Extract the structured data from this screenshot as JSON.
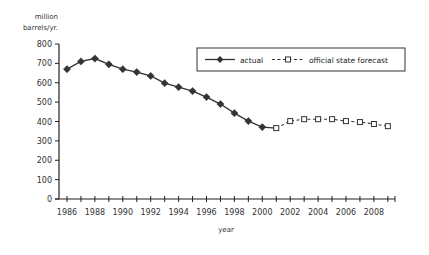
{
  "chart_data": {
    "type": "line",
    "title": "",
    "ylabel": "million barrels/yr.",
    "ylabel_lines": [
      "million",
      "barrels/yr."
    ],
    "xlabel": "year",
    "ylim": [
      0,
      800
    ],
    "yticks": [
      0,
      100,
      200,
      300,
      400,
      500,
      600,
      700,
      800
    ],
    "xlim": [
      1986,
      2009
    ],
    "xtick_labels": [
      "1986",
      "1988",
      "1990",
      "1992",
      "1994",
      "1996",
      "1998",
      "2000",
      "2002",
      "2004",
      "2006",
      "2008"
    ],
    "grid": false,
    "legend_position": "upper right",
    "series": [
      {
        "name": "actual",
        "style": "solid line, filled diamond markers",
        "color": "#333333",
        "x": [
          1986,
          1987,
          1988,
          1989,
          1990,
          1991,
          1992,
          1993,
          1994,
          1995,
          1996,
          1997,
          1998,
          1999,
          2000,
          2001
        ],
        "values": [
          670,
          710,
          725,
          695,
          670,
          655,
          635,
          598,
          577,
          557,
          526,
          490,
          443,
          402,
          371,
          366
        ]
      },
      {
        "name": "official state forecast",
        "style": "dashed line, open square markers",
        "color": "#333333",
        "x": [
          2001,
          2002,
          2003,
          2004,
          2005,
          2006,
          2007,
          2008,
          2009
        ],
        "values": [
          366,
          402,
          412,
          412,
          412,
          402,
          397,
          387,
          376
        ]
      }
    ]
  }
}
